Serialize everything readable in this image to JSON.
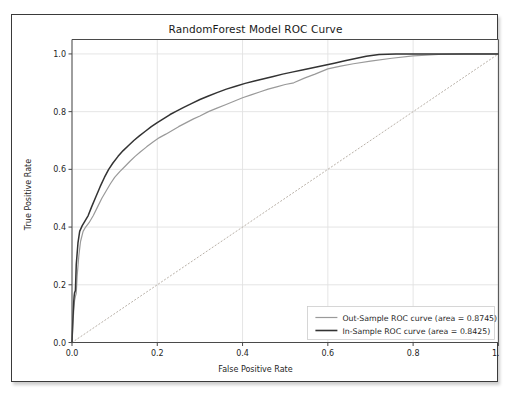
{
  "figure": {
    "title": "RandomForest Model ROC Curve"
  },
  "chart_data": {
    "type": "line",
    "title": "RandomForest Model ROC Curve",
    "xlabel": "False Positive Rate",
    "ylabel": "True Positive Rate",
    "xlim": [
      0.0,
      1.0
    ],
    "ylim": [
      0.0,
      1.05
    ],
    "grid": true,
    "legend_position": "lower right",
    "xticks": [
      "0.0",
      "0.2",
      "0.4",
      "0.6",
      "0.8",
      "1.0"
    ],
    "xtick_values": [
      0.0,
      0.2,
      0.4,
      0.6,
      0.8,
      1.0
    ],
    "yticks": [
      "0.0",
      "0.2",
      "0.4",
      "0.6",
      "0.8",
      "1.0"
    ],
    "ytick_values": [
      0.0,
      0.2,
      0.4,
      0.6,
      0.8,
      1.0
    ],
    "colors": {
      "out_sample": "#9a9a9a",
      "in_sample": "#333333",
      "chance_line": "#b9b1a8",
      "grid": "#e2e2e2",
      "axes": "#4a4a4a"
    },
    "series": [
      {
        "name": "Out-Sample ROC curve (area = 0.8745)",
        "area": 0.8745,
        "color": "#9a9a9a",
        "style": "solid",
        "x": [
          0.0,
          0.002,
          0.004,
          0.006,
          0.008,
          0.01,
          0.012,
          0.016,
          0.02,
          0.026,
          0.032,
          0.04,
          0.05,
          0.06,
          0.07,
          0.08,
          0.09,
          0.1,
          0.112,
          0.124,
          0.136,
          0.148,
          0.16,
          0.175,
          0.19,
          0.205,
          0.22,
          0.235,
          0.25,
          0.268,
          0.285,
          0.3,
          0.32,
          0.34,
          0.36,
          0.38,
          0.4,
          0.42,
          0.44,
          0.46,
          0.48,
          0.5,
          0.52,
          0.545,
          0.57,
          0.6,
          0.63,
          0.66,
          0.7,
          0.75,
          0.8,
          0.86,
          0.92,
          1.0
        ],
        "y": [
          0.0,
          0.06,
          0.11,
          0.145,
          0.16,
          0.17,
          0.23,
          0.3,
          0.35,
          0.385,
          0.4,
          0.415,
          0.44,
          0.47,
          0.5,
          0.525,
          0.55,
          0.572,
          0.592,
          0.61,
          0.628,
          0.645,
          0.66,
          0.678,
          0.695,
          0.71,
          0.722,
          0.735,
          0.748,
          0.762,
          0.775,
          0.785,
          0.8,
          0.812,
          0.824,
          0.836,
          0.848,
          0.858,
          0.868,
          0.878,
          0.886,
          0.894,
          0.9,
          0.916,
          0.93,
          0.948,
          0.958,
          0.966,
          0.975,
          0.985,
          0.993,
          0.998,
          1.0,
          1.0
        ]
      },
      {
        "name": "In-Sample ROC curve (area = 0.8425)",
        "area": 0.8425,
        "color": "#333333",
        "style": "solid",
        "x": [
          0.0,
          0.002,
          0.004,
          0.005,
          0.006,
          0.008,
          0.01,
          0.014,
          0.018,
          0.024,
          0.03,
          0.038,
          0.046,
          0.056,
          0.066,
          0.076,
          0.086,
          0.096,
          0.108,
          0.12,
          0.132,
          0.145,
          0.158,
          0.172,
          0.186,
          0.2,
          0.215,
          0.23,
          0.245,
          0.262,
          0.28,
          0.3,
          0.32,
          0.34,
          0.362,
          0.384,
          0.406,
          0.428,
          0.45,
          0.472,
          0.494,
          0.516,
          0.54,
          0.565,
          0.59,
          0.615,
          0.64,
          0.665,
          0.69,
          0.72,
          0.76,
          0.82,
          0.9,
          1.0
        ],
        "y": [
          0.0,
          0.08,
          0.14,
          0.16,
          0.172,
          0.18,
          0.27,
          0.345,
          0.385,
          0.405,
          0.42,
          0.44,
          0.47,
          0.505,
          0.54,
          0.572,
          0.6,
          0.622,
          0.645,
          0.665,
          0.682,
          0.7,
          0.716,
          0.732,
          0.748,
          0.762,
          0.776,
          0.79,
          0.802,
          0.815,
          0.828,
          0.842,
          0.854,
          0.866,
          0.878,
          0.888,
          0.898,
          0.906,
          0.914,
          0.922,
          0.93,
          0.937,
          0.944,
          0.952,
          0.96,
          0.968,
          0.976,
          0.984,
          0.992,
          0.998,
          1.0,
          1.0,
          1.0,
          1.0
        ]
      }
    ],
    "reference_line": {
      "name": "chance",
      "style": "dotted",
      "color": "#b9b1a8",
      "x": [
        0.0,
        1.0
      ],
      "y": [
        0.0,
        1.0
      ]
    }
  },
  "legend": {
    "items": [
      {
        "label": "Out-Sample ROC curve (area = 0.8745)",
        "color": "#9a9a9a"
      },
      {
        "label": "In-Sample ROC curve (area = 0.8425)",
        "color": "#333333"
      }
    ]
  }
}
